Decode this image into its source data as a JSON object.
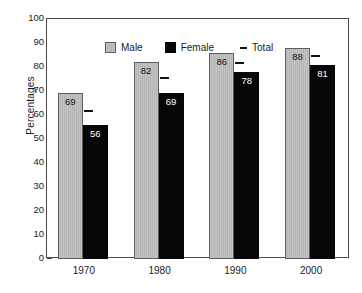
{
  "chart_data": {
    "type": "bar",
    "title": "",
    "subtitle": "",
    "xlabel": "",
    "ylabel": "Percentages",
    "categories": [
      "1970",
      "1980",
      "1990",
      "2000"
    ],
    "series": [
      {
        "name": "Male",
        "values": [
          69,
          82,
          86,
          88
        ],
        "color": "#c0c0c0"
      },
      {
        "name": "Female",
        "values": [
          56,
          69,
          78,
          81
        ],
        "color": "#070707"
      },
      {
        "name": "Total",
        "values": [
          62,
          76,
          82,
          85
        ],
        "color": "#111111",
        "marker": "dash"
      }
    ],
    "ylim": [
      0,
      100
    ],
    "yticks": [
      0,
      10,
      20,
      30,
      40,
      50,
      60,
      70,
      80,
      90,
      100
    ],
    "ytick_labels": [
      "0",
      "10",
      "20",
      "30",
      "40",
      "50",
      "60",
      "70",
      "80",
      "90",
      "100"
    ],
    "grid": false,
    "legend_position": "top-left",
    "data_labels": {
      "Male": [
        "69",
        "82",
        "86",
        "88"
      ],
      "Female": [
        "56",
        "69",
        "78",
        "81"
      ]
    }
  },
  "legend": {
    "items": [
      {
        "label": "Male",
        "marker": "gray-square-swatch"
      },
      {
        "label": "Female",
        "marker": "black-square-swatch"
      },
      {
        "label": "Total",
        "marker": "dash-marker"
      }
    ]
  },
  "axes": {
    "y_title": "Percentages"
  }
}
